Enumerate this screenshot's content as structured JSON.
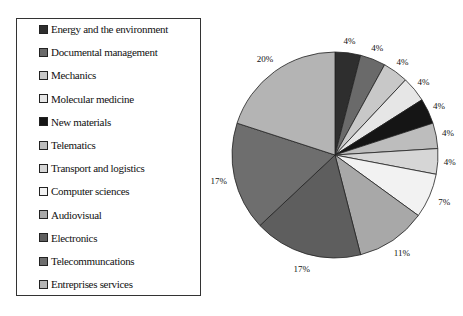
{
  "chart_data": {
    "type": "pie",
    "title": "",
    "legend_position": "left",
    "start_angle": "12 o'clock, clockwise",
    "categories": [
      "Energy and the environment",
      "Documental management",
      "Mechanics",
      "Molecular medicine",
      "New materials",
      "Telematics",
      "Transport and logistics",
      "Computer sciences",
      "Audiovisual",
      "Electronics",
      "Telecommuncations",
      "Entreprises services"
    ],
    "values": [
      4,
      4,
      4,
      4,
      4,
      4,
      4,
      7,
      11,
      17,
      17,
      20
    ],
    "labels": [
      "4%",
      "4%",
      "4%",
      "4%",
      "4%",
      "4%",
      "4%",
      "7%",
      "11%",
      "17%",
      "17%",
      "20%"
    ],
    "colors": [
      "#2e2e2e",
      "#6a6a6a",
      "#c8c8c8",
      "#e6e6e6",
      "#151515",
      "#bdbdbd",
      "#d6d6d6",
      "#f2f2f2",
      "#a8a8a8",
      "#5e5e5e",
      "#6e6e6e",
      "#b4b4b4"
    ]
  },
  "legend": {
    "items": [
      {
        "label": "Energy and the environment"
      },
      {
        "label": "Documental management"
      },
      {
        "label": "Mechanics"
      },
      {
        "label": "Molecular medicine"
      },
      {
        "label": "New materials"
      },
      {
        "label": "Telematics"
      },
      {
        "label": "Transport and logistics"
      },
      {
        "label": "Computer sciences"
      },
      {
        "label": "Audiovisual"
      },
      {
        "label": "Electronics"
      },
      {
        "label": "Telecommuncations"
      },
      {
        "label": "Entreprises services"
      }
    ]
  }
}
